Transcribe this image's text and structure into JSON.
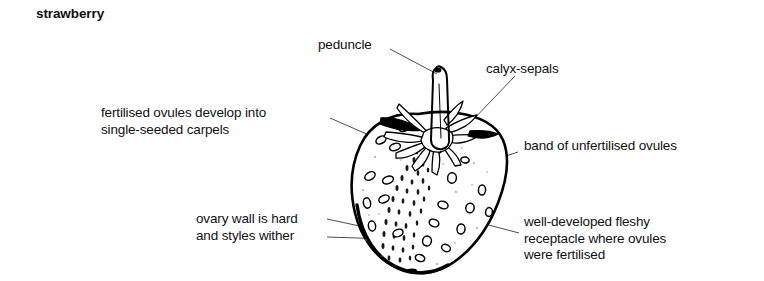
{
  "figure": {
    "title": "strawberry",
    "kind": "botanical-line-diagram"
  },
  "labels": {
    "peduncle": {
      "lines": [
        "peduncle"
      ]
    },
    "calyx_sepals": {
      "lines": [
        "calyx-sepals"
      ]
    },
    "fertilised_ovules": {
      "lines": [
        "fertilised ovules develop into",
        "single-seeded carpels"
      ]
    },
    "band_unfertilised": {
      "lines": [
        "band of unfertilised ovules"
      ]
    },
    "ovary_wall": {
      "lines": [
        "ovary wall is hard",
        "and styles wither"
      ]
    },
    "receptacle": {
      "lines": [
        "well-developed fleshy",
        "receptacle where ovules",
        "were fertilised"
      ]
    }
  },
  "colors": {
    "ink": "#000000",
    "leader": "#3a3a3a",
    "paper": "#ffffff",
    "text": "#111111"
  }
}
